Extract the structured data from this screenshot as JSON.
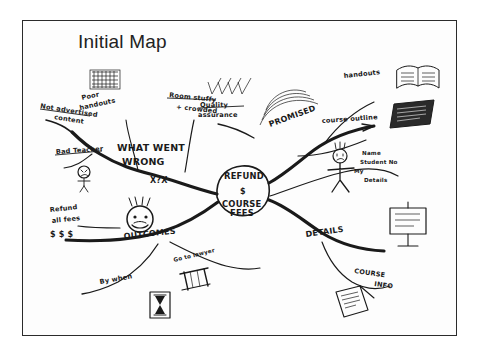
{
  "document": {
    "title": "Initial Map",
    "type": "hand-drawn mind map photograph",
    "background_color": "#ffffff",
    "frame_color": "#2b2b2b",
    "ink_color": "#1a1a1a"
  },
  "mindmap": {
    "center": {
      "label_line1": "REFUND",
      "label_symbol": "$",
      "label_line2": "COURSE",
      "label_line3": "FEES"
    },
    "branches": [
      {
        "id": "what-went-wrong",
        "label_line1": "WHAT WENT",
        "label_line2": "WRONG",
        "marks": "X?X",
        "direction": "upper-left",
        "children": [
          {
            "id": "poor-handouts",
            "label_line1": "Poor",
            "label_line2": "handouts",
            "icon": "hatched-sheet-icon"
          },
          {
            "id": "not-advertised-content",
            "label_line1": "Not advertised",
            "label_line2": "content",
            "icon": "none"
          },
          {
            "id": "room-stuffy-crowded",
            "label_line1": "Room stuffy",
            "label_line2": "+ crowded",
            "icon": "none"
          },
          {
            "id": "bad-teacher",
            "label_line1": "Bad Teacher",
            "label_line2": "",
            "icon": "angry-face-icon"
          }
        ]
      },
      {
        "id": "promised",
        "label_line1": "PROMISED",
        "label_line2": "",
        "direction": "upper-right",
        "icon": "rainbow-arc-icon",
        "children": [
          {
            "id": "handouts",
            "label_line1": "handouts",
            "label_line2": "",
            "icon": "open-book-icon"
          },
          {
            "id": "course-outline",
            "label_line1": "course outline",
            "label_line2": "",
            "icon": "dark-page-icon"
          }
        ]
      },
      {
        "id": "quality-assurance",
        "label_line1": "Quality",
        "label_line2": "assurance",
        "direction": "top-center",
        "icon": "checkmarks-icon"
      },
      {
        "id": "details",
        "label_line1": "DETAILS",
        "label_line2": "",
        "direction": "right",
        "icon": "whiteboard-icon",
        "children": [
          {
            "id": "my-details",
            "label_line1": "Name",
            "label_line2": "Student No",
            "label_line3": "My",
            "label_line4": "Details",
            "icon": "stick-figure-icon"
          },
          {
            "id": "course-info",
            "label_line1": "COURSE",
            "label_line2": "INFO",
            "icon": "clipboard-icon"
          }
        ]
      },
      {
        "id": "outcomes",
        "label_line1": "OUTCOMES",
        "label_line2": "",
        "direction": "lower-left",
        "icon": "smiley-head-icon",
        "children": [
          {
            "id": "refund-all-fees",
            "label_line1": "Refund",
            "label_line2": "all fees",
            "label_line3": "$ $ $",
            "icon": "none"
          },
          {
            "id": "by-when",
            "label_line1": "By when",
            "label_line2": "",
            "icon": "hourglass-icon"
          },
          {
            "id": "go-to-lawyer",
            "label_line1": "Go to lawyer",
            "label_line2": "",
            "icon": "scales-of-justice-icon"
          }
        ]
      }
    ]
  }
}
